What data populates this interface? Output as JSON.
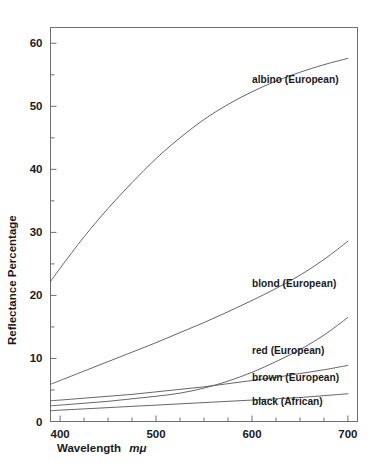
{
  "chart_data": {
    "type": "line",
    "title": "",
    "xlabel": "Wavelength mμ",
    "xlabel_plain": "Wavelength",
    "xlabel_italic": "mμ",
    "ylabel": "Reflectance Percentage",
    "xlim": [
      390,
      710
    ],
    "ylim": [
      0,
      62.5
    ],
    "grid": false,
    "legend_position": "inline-right-of-curve",
    "x_major_ticks": [
      400,
      500,
      600,
      700
    ],
    "x_major_tick_labels": [
      "400",
      "500",
      "600",
      "700"
    ],
    "x_minor_tick_step": 25,
    "y_major_ticks": [
      0,
      10,
      20,
      30,
      40,
      50,
      60
    ],
    "y_major_tick_labels": [
      "0",
      "10",
      "20",
      "30",
      "40",
      "50",
      "60"
    ],
    "y_minor_tick_step": 5,
    "x": [
      390,
      400,
      425,
      450,
      475,
      500,
      525,
      550,
      575,
      600,
      625,
      650,
      675,
      700
    ],
    "series": [
      {
        "name": "albino (European)",
        "label": "albino (European)",
        "label_x": 600,
        "label_y": 54.2,
        "color": "#555555",
        "values": [
          22.2,
          24.3,
          29.3,
          33.8,
          37.9,
          41.7,
          45.0,
          47.9,
          50.3,
          52.3,
          54.0,
          55.4,
          56.6,
          57.6
        ]
      },
      {
        "name": "blond (European)",
        "label": "blond (European)",
        "label_x": 600,
        "label_y": 21.9,
        "color": "#555555",
        "values": [
          5.9,
          6.5,
          8.0,
          9.5,
          11.0,
          12.5,
          14.1,
          15.7,
          17.4,
          19.2,
          21.1,
          23.2,
          25.7,
          28.6
        ]
      },
      {
        "name": "red (European)",
        "label": "red (European)",
        "label_x": 600,
        "label_y": 11.3,
        "color": "#555555",
        "values": [
          2.5,
          2.6,
          2.9,
          3.2,
          3.6,
          4.0,
          4.5,
          5.3,
          6.4,
          7.8,
          9.5,
          11.4,
          13.7,
          16.5
        ]
      },
      {
        "name": "brown (European)",
        "label": "brown (European)",
        "label_x": 600,
        "label_y": 7.0,
        "color": "#555555",
        "values": [
          3.3,
          3.4,
          3.7,
          4.0,
          4.3,
          4.7,
          5.1,
          5.5,
          6.0,
          6.5,
          7.0,
          7.6,
          8.2,
          8.9
        ]
      },
      {
        "name": "black (African)",
        "label": "black (African)",
        "label_x": 600,
        "label_y": 3.2,
        "color": "#555555",
        "values": [
          1.7,
          1.8,
          2.0,
          2.2,
          2.4,
          2.6,
          2.8,
          3.0,
          3.2,
          3.4,
          3.6,
          3.8,
          4.1,
          4.4
        ]
      }
    ]
  }
}
